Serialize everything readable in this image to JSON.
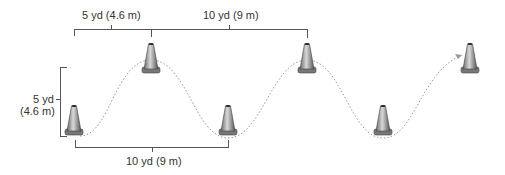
{
  "diagram": {
    "labels": {
      "top_left": "5 yd (4.6 m)",
      "top_right": "10 yd (9 m)",
      "left_line1": "5 yd",
      "left_line2": "(4.6 m)",
      "bottom": "10 yd (9 m)"
    },
    "cones": [
      {
        "id": 1,
        "row": "bottom",
        "x": 74,
        "y": 132
      },
      {
        "id": 2,
        "row": "top",
        "x": 151,
        "y": 70
      },
      {
        "id": 3,
        "row": "bottom",
        "x": 228,
        "y": 132
      },
      {
        "id": 4,
        "row": "top",
        "x": 307,
        "y": 70
      },
      {
        "id": 5,
        "row": "bottom",
        "x": 383,
        "y": 132
      },
      {
        "id": 6,
        "row": "top",
        "x": 470,
        "y": 70
      }
    ],
    "colors": {
      "line": "#555555",
      "path": "#999999",
      "cone": "#8a8a8a"
    }
  }
}
